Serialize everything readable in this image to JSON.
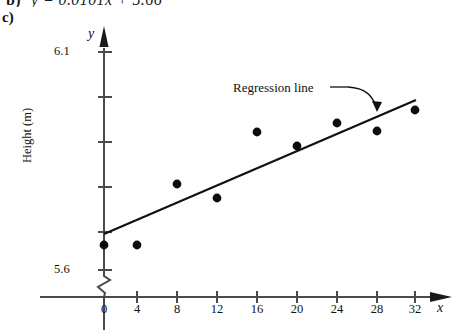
{
  "figure": {
    "part_label": "c)",
    "clipped_equation_prefix": "b)",
    "clipped_equation_body": "y = 0.0101x + 5.66",
    "annotation": "Regression line",
    "axis_letter_x": "x",
    "axis_letter_y": "y"
  },
  "chart_data": {
    "type": "scatter",
    "title": "",
    "subtitle": "",
    "xlabel": "x",
    "ylabel": "Height (m)",
    "x": [
      0,
      4,
      8,
      12,
      16,
      20,
      24,
      28,
      32
    ],
    "values": [
      5.665,
      5.665,
      5.805,
      5.775,
      5.895,
      5.865,
      5.915,
      5.9,
      5.945
    ],
    "series": [
      {
        "name": "Data points",
        "x": [
          0,
          4,
          8,
          12,
          16,
          20,
          24,
          28,
          32
        ],
        "values": [
          5.665,
          5.665,
          5.805,
          5.775,
          5.895,
          5.865,
          5.915,
          5.9,
          5.945
        ]
      },
      {
        "name": "Regression line",
        "type": "line",
        "x": [
          0,
          32
        ],
        "values": [
          5.68,
          5.97
        ]
      }
    ],
    "xlim": [
      -2,
      34
    ],
    "ylim": [
      5.6,
      6.1
    ],
    "xticks": [
      0,
      4,
      8,
      12,
      16,
      20,
      24,
      28,
      32
    ],
    "xticklabels": [
      "0",
      "4",
      "8",
      "12",
      "16",
      "20",
      "24",
      "28",
      "32"
    ],
    "yticks": [
      5.6,
      5.7,
      5.8,
      5.9,
      6.0,
      6.1
    ],
    "yticklabels_shown": [
      "5.6",
      "6.1"
    ],
    "y_axis_break": true,
    "grid": false,
    "legend": "none",
    "annotations": [
      {
        "text": "Regression line",
        "points_to": "regression-line"
      }
    ]
  },
  "y_tick_labels": [
    {
      "text": "6.1",
      "left": 54,
      "top": 44
    },
    {
      "text": "5.6",
      "left": 54,
      "top": 262
    }
  ],
  "x_tick_labels": [
    {
      "text": "0",
      "cx": 104
    },
    {
      "text": "4",
      "cx": 137
    },
    {
      "text": "8",
      "cx": 177
    },
    {
      "text": "12",
      "cx": 217
    },
    {
      "text": "16",
      "cx": 257
    },
    {
      "text": "20",
      "cx": 297
    },
    {
      "text": "24",
      "cx": 337
    },
    {
      "text": "28",
      "cx": 377
    },
    {
      "text": "32",
      "cx": 415
    }
  ]
}
